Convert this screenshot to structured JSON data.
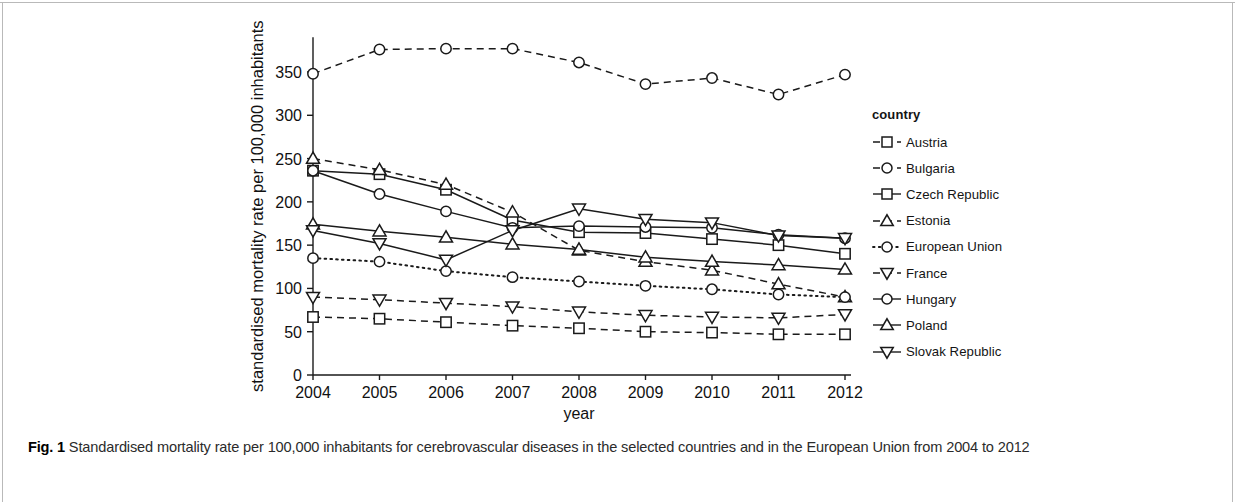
{
  "caption": {
    "label": "Fig. 1",
    "text": "Standardised mortality rate per 100,000 inhabitants for cerebrovascular diseases in the selected countries and in the European Union from 2004 to 2012"
  },
  "legend": {
    "title": "country",
    "entries": [
      {
        "label": "Austria",
        "marker": "square",
        "dash": "dashed"
      },
      {
        "label": "Bulgaria",
        "marker": "circle",
        "dash": "dashed"
      },
      {
        "label": "Czech Republic",
        "marker": "square",
        "dash": "solid"
      },
      {
        "label": "Estonia",
        "marker": "triangle-up",
        "dash": "dashed"
      },
      {
        "label": "European Union",
        "marker": "circle",
        "dash": "dotted"
      },
      {
        "label": "France",
        "marker": "triangle-down",
        "dash": "dashed"
      },
      {
        "label": "Hungary",
        "marker": "circle",
        "dash": "solid"
      },
      {
        "label": "Poland",
        "marker": "triangle-up",
        "dash": "solid"
      },
      {
        "label": "Slovak Republic",
        "marker": "triangle-down",
        "dash": "solid"
      }
    ]
  },
  "chart_data": {
    "type": "line",
    "title": "",
    "xlabel": "year",
    "ylabel": "standardised mortality rate per 100,000 inhabitants",
    "x": [
      2004,
      2005,
      2006,
      2007,
      2008,
      2009,
      2010,
      2011,
      2012
    ],
    "xtick_labels": [
      "2004",
      "2005",
      "2006",
      "2007",
      "2008",
      "2009",
      "2010",
      "2011",
      "2012"
    ],
    "ytick_labels": [
      "0",
      "50",
      "100",
      "150",
      "200",
      "250",
      "300",
      "350"
    ],
    "yticks": [
      0,
      50,
      100,
      150,
      200,
      250,
      300,
      350
    ],
    "xlim": [
      2004,
      2012
    ],
    "ylim": [
      0,
      390
    ],
    "grid": false,
    "legend_position": "right",
    "series": [
      {
        "name": "Austria",
        "marker": "square",
        "dash": "dashed",
        "values": [
          67,
          65,
          61,
          57,
          54,
          50,
          49,
          47,
          47
        ]
      },
      {
        "name": "Bulgaria",
        "marker": "circle",
        "dash": "dashed",
        "values": [
          348,
          376,
          377,
          377,
          361,
          336,
          343,
          324,
          347
        ]
      },
      {
        "name": "Czech Republic",
        "marker": "square",
        "dash": "solid",
        "values": [
          236,
          232,
          214,
          179,
          165,
          164,
          157,
          150,
          140
        ]
      },
      {
        "name": "Estonia",
        "marker": "triangle-up",
        "dash": "dashed",
        "values": [
          250,
          237,
          220,
          188,
          144,
          131,
          121,
          105,
          90
        ]
      },
      {
        "name": "European Union",
        "marker": "circle",
        "dash": "dotted",
        "values": [
          135,
          131,
          120,
          113,
          108,
          103,
          99,
          93,
          90
        ]
      },
      {
        "name": "France",
        "marker": "triangle-down",
        "dash": "dashed",
        "values": [
          90,
          87,
          83,
          79,
          73,
          69,
          67,
          66,
          70
        ]
      },
      {
        "name": "Hungary",
        "marker": "circle",
        "dash": "solid",
        "values": [
          236,
          209,
          189,
          170,
          172,
          171,
          170,
          162,
          158
        ]
      },
      {
        "name": "Poland",
        "marker": "triangle-up",
        "dash": "solid",
        "values": [
          174,
          166,
          159,
          151,
          145,
          136,
          131,
          127,
          122
        ]
      },
      {
        "name": "Slovak Republic",
        "marker": "triangle-down",
        "dash": "solid",
        "values": [
          167,
          152,
          133,
          167,
          192,
          180,
          176,
          161,
          158
        ]
      }
    ]
  }
}
